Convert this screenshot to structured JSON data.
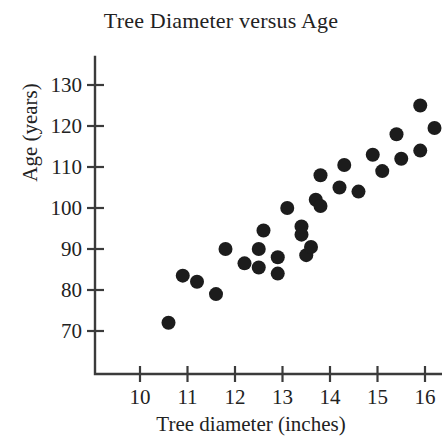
{
  "figure": {
    "title": "Tree Diameter versus Age",
    "x_axis_label": "Tree diameter (inches)",
    "y_axis_label": "Age (years)"
  },
  "chart_data": {
    "type": "scatter",
    "title": "Tree Diameter versus Age",
    "xlabel": "Tree diameter (inches)",
    "ylabel": "Age (years)",
    "xlim": [
      9.3,
      16.7
    ],
    "ylim": [
      64,
      134
    ],
    "xticks": [
      10,
      11,
      12,
      13,
      14,
      15,
      16
    ],
    "yticks": [
      70,
      80,
      90,
      100,
      110,
      120,
      130
    ],
    "xtick_labels": [
      "10",
      "11",
      "12",
      "13",
      "14",
      "15",
      "16"
    ],
    "ytick_labels": [
      "70",
      "80",
      "90",
      "100",
      "110",
      "120",
      "130"
    ],
    "grid": false,
    "legend": null,
    "marker": "circle",
    "marker_color": "#1c1c1c",
    "marker_size": 7,
    "n_points": 28,
    "points": [
      {
        "x": 10.6,
        "y": 72
      },
      {
        "x": 10.9,
        "y": 83.5
      },
      {
        "x": 11.2,
        "y": 82
      },
      {
        "x": 11.6,
        "y": 79
      },
      {
        "x": 11.8,
        "y": 90
      },
      {
        "x": 12.2,
        "y": 86.5
      },
      {
        "x": 12.5,
        "y": 90
      },
      {
        "x": 12.5,
        "y": 85.5
      },
      {
        "x": 12.6,
        "y": 94.5
      },
      {
        "x": 12.9,
        "y": 88
      },
      {
        "x": 12.9,
        "y": 84
      },
      {
        "x": 13.1,
        "y": 100
      },
      {
        "x": 13.4,
        "y": 93.5
      },
      {
        "x": 13.5,
        "y": 88.5
      },
      {
        "x": 13.4,
        "y": 95.5
      },
      {
        "x": 13.6,
        "y": 90.5
      },
      {
        "x": 13.7,
        "y": 102
      },
      {
        "x": 13.8,
        "y": 108
      },
      {
        "x": 13.8,
        "y": 100.5
      },
      {
        "x": 14.2,
        "y": 105
      },
      {
        "x": 14.3,
        "y": 110.5
      },
      {
        "x": 14.6,
        "y": 104
      },
      {
        "x": 14.9,
        "y": 113
      },
      {
        "x": 15.1,
        "y": 109
      },
      {
        "x": 15.4,
        "y": 118
      },
      {
        "x": 15.5,
        "y": 112
      },
      {
        "x": 15.9,
        "y": 114
      },
      {
        "x": 15.9,
        "y": 125
      },
      {
        "x": 16.2,
        "y": 119.5
      }
    ]
  }
}
